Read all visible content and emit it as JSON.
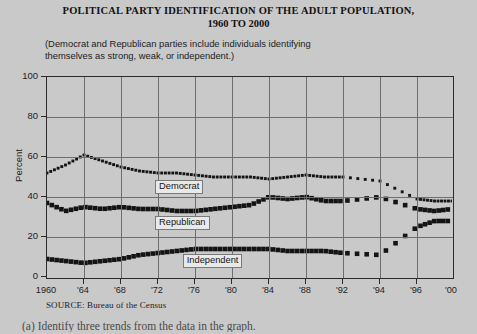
{
  "chart_data": {
    "type": "line",
    "title": "POLITICAL PARTY IDENTIFICATION OF THE ADULT POPULATION,",
    "title_line2": "1960 TO 2000",
    "subtitle": "(Democrat and Republican parties include individuals identifying themselves as strong, weak, or independent.)",
    "xlabel": "",
    "ylabel": "Percent",
    "ylim": [
      0,
      100
    ],
    "yticks": [
      0,
      20,
      40,
      60,
      80,
      100
    ],
    "grid": true,
    "legend_position": "inline-labels",
    "source": "SOURCE: Bureau of the Census",
    "xtick_labels": [
      "1960",
      "'64",
      "'68",
      "'72",
      "'76",
      "'80",
      "'84",
      "'88",
      "'92",
      "'94",
      "'96",
      "'00"
    ],
    "xtick_years": [
      1960,
      1964,
      1968,
      1972,
      1976,
      1980,
      1984,
      1988,
      1992,
      1994,
      1996,
      2000
    ],
    "x": [
      1960,
      1962,
      1964,
      1966,
      1968,
      1970,
      1972,
      1974,
      1976,
      1978,
      1980,
      1982,
      1984,
      1986,
      1988,
      1990,
      1992,
      1994,
      1996,
      1998,
      2000
    ],
    "series": [
      {
        "name": "Democrat",
        "marker": "small-square",
        "values": [
          52,
          56,
          61,
          58,
          55,
          53,
          52,
          52,
          51,
          50,
          50,
          50,
          49,
          50,
          51,
          50,
          50,
          48,
          39,
          38,
          38
        ]
      },
      {
        "name": "Republican",
        "marker": "large-square",
        "values": [
          37,
          33,
          35,
          34,
          35,
          34,
          34,
          33,
          33,
          34,
          35,
          36,
          40,
          39,
          40,
          38,
          38,
          40,
          34,
          33,
          34
        ]
      },
      {
        "name": "Independent",
        "marker": "large-square",
        "values": [
          9,
          8,
          7,
          8,
          9,
          11,
          12,
          13,
          14,
          14,
          14,
          14,
          14,
          13,
          13,
          13,
          12,
          11,
          25,
          28,
          28
        ]
      }
    ],
    "annotations": [
      {
        "text": "Democrat",
        "x": 1972,
        "y": 45
      },
      {
        "text": "Republican",
        "x": 1972,
        "y": 27
      },
      {
        "text": "Independent",
        "x": 1975,
        "y": 8
      }
    ]
  },
  "footer": {
    "question": "(a)  Identify three trends from the data in the graph."
  },
  "colors": {
    "background": "#c9c9c9",
    "axis": "#2b2b2b",
    "grid": "#6e6e6e",
    "marker": "#141414",
    "label_box": "#e9e9e9"
  }
}
